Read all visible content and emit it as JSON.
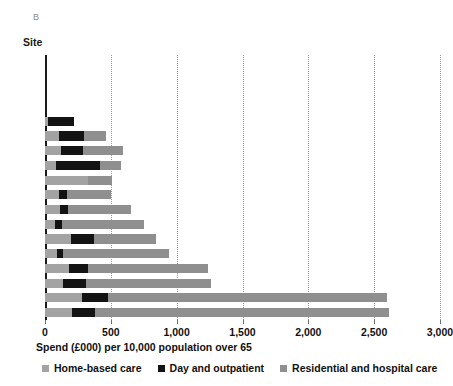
{
  "panel": {
    "letter": "B"
  },
  "axes": {
    "y_title": "Site",
    "x_title": "Spend (£000) per 10,000 population over 65",
    "x_ticks": [
      "0",
      "500",
      "1,000",
      "1,500",
      "2,000",
      "2,500",
      "3,000"
    ]
  },
  "legend": {
    "items": [
      {
        "label": "Home-based care",
        "swatch": "home",
        "color": "#a3a3a3"
      },
      {
        "label": "Day and outpatient",
        "swatch": "day",
        "color": "#131313"
      },
      {
        "label": "Residential and hospital care",
        "swatch": "resid",
        "color": "#8f8f8f"
      }
    ]
  },
  "chart_data": {
    "type": "bar",
    "orientation": "horizontal",
    "stacked": true,
    "title": "",
    "xlabel": "Spend (£000) per 10,000 population over 65",
    "ylabel": "Site",
    "xlim": [
      0,
      3000
    ],
    "xticks": [
      0,
      500,
      1000,
      1500,
      2000,
      2500,
      3000
    ],
    "grid": "vertical-dotted",
    "legend_position": "bottom",
    "categories": [
      "Site 1",
      "Site 2",
      "Site 3",
      "Site 4",
      "Site 5",
      "Site 6",
      "Site 7",
      "Site 8",
      "Site 9",
      "Site 10",
      "Site 11",
      "Site 12",
      "Site 13",
      "Site 14",
      "Site 15",
      "Site 16",
      "Site 17",
      "Site 18"
    ],
    "series": [
      {
        "name": "Home-based care",
        "color": "#a3a3a3",
        "values": [
          0,
          0,
          0,
          0,
          20,
          110,
          120,
          80,
          330,
          110,
          115,
          75,
          195,
          90,
          185,
          135,
          280,
          205
        ]
      },
      {
        "name": "Day and outpatient",
        "color": "#131313",
        "values": [
          0,
          0,
          0,
          0,
          200,
          190,
          165,
          340,
          0,
          55,
          60,
          55,
          180,
          45,
          140,
          180,
          200,
          175
        ]
      },
      {
        "name": "Residential and hospital care",
        "color": "#8f8f8f",
        "values": [
          0,
          0,
          0,
          0,
          0,
          165,
          310,
          160,
          180,
          340,
          475,
          625,
          465,
          810,
          915,
          945,
          2115,
          2230
        ]
      }
    ],
    "totals": [
      0,
      0,
      0,
      0,
      220,
      465,
      595,
      580,
      510,
      505,
      650,
      755,
      840,
      945,
      1240,
      1260,
      2595,
      2610
    ]
  }
}
